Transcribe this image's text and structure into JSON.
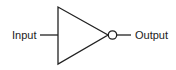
{
  "diagram": {
    "type": "logic-gate",
    "gate": "NOT",
    "input_label": "Input",
    "output_label": "Output",
    "stroke_color": "#222222"
  }
}
